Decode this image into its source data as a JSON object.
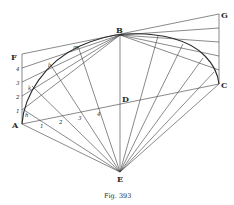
{
  "figure": {
    "caption": "Fig. 393",
    "colors": {
      "ink": "#2a2a2a",
      "background": "#ffffff"
    },
    "points": {
      "A": {
        "label": "A",
        "x": 22,
        "y": 124
      },
      "B": {
        "label": "B",
        "x": 120,
        "y": 35
      },
      "C": {
        "label": "C",
        "x": 219,
        "y": 84
      },
      "D": {
        "label": "D",
        "x": 120,
        "y": 104
      },
      "E": {
        "label": "E",
        "x": 120,
        "y": 172
      },
      "F": {
        "label": "F",
        "x": 22,
        "y": 54
      },
      "G": {
        "label": "G",
        "x": 219,
        "y": 14
      }
    },
    "left_side_numbers": [
      "1",
      "2",
      "3",
      "4"
    ],
    "base_numbers": [
      "1",
      "2",
      "3",
      "4"
    ],
    "curve_labels": [
      "h",
      "k",
      "l",
      "m"
    ]
  }
}
